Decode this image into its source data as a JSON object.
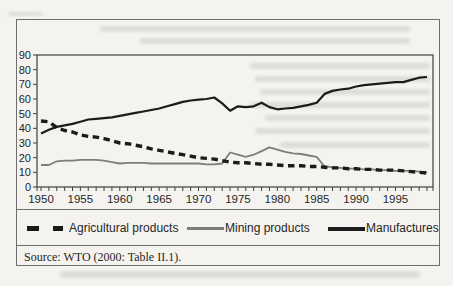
{
  "figure": {
    "source_note": "Source: WTO (2000: Table II.1)."
  },
  "chart_data": {
    "type": "line",
    "title": "",
    "xlabel": "",
    "ylabel": "",
    "ylim": [
      0,
      90
    ],
    "xlim": [
      1950,
      1999
    ],
    "grid": false,
    "legend_position": "bottom",
    "y_ticks": [
      90,
      80,
      70,
      60,
      50,
      40,
      30,
      20,
      10,
      0
    ],
    "x_tick_labels": [
      "1950",
      "1955",
      "1960",
      "1965",
      "1970",
      "1975",
      "1980",
      "1985",
      "1990",
      "1995"
    ],
    "x": [
      1950,
      1951,
      1952,
      1953,
      1954,
      1955,
      1956,
      1957,
      1958,
      1959,
      1960,
      1961,
      1962,
      1963,
      1964,
      1965,
      1966,
      1967,
      1968,
      1969,
      1970,
      1971,
      1972,
      1973,
      1974,
      1975,
      1976,
      1977,
      1978,
      1979,
      1980,
      1981,
      1982,
      1983,
      1984,
      1985,
      1986,
      1987,
      1988,
      1989,
      1990,
      1991,
      1992,
      1993,
      1994,
      1995,
      1996,
      1997,
      1998,
      1999
    ],
    "series": [
      {
        "name": "Agricultural products",
        "style": "dashed",
        "color": "#1b1b1b",
        "values": [
          45,
          44.5,
          40.5,
          38.5,
          37.5,
          35.5,
          34.5,
          34,
          33,
          31.5,
          30,
          29.5,
          28.5,
          27.5,
          26,
          25,
          24,
          23,
          22,
          21,
          20,
          19.5,
          19,
          18,
          17,
          16.5,
          16.5,
          16,
          15.5,
          15.5,
          15,
          14.5,
          14.5,
          14.5,
          14,
          14,
          13.5,
          13,
          13,
          12.5,
          12.5,
          12,
          12,
          11.5,
          11.5,
          11.5,
          11,
          10.5,
          10,
          9.5
        ]
      },
      {
        "name": "Mining products",
        "style": "solid",
        "color": "#7d7d7d",
        "values": [
          15,
          15,
          17.5,
          18,
          18,
          18.5,
          18.5,
          18.5,
          18,
          17,
          16,
          16.5,
          16.5,
          16.5,
          16,
          16,
          16,
          16,
          16,
          16,
          16,
          15.5,
          15.5,
          16,
          23.5,
          22,
          20.5,
          22,
          24.5,
          27,
          25.5,
          24,
          23,
          22.5,
          21.5,
          20.5,
          14,
          13.5,
          13,
          12.5,
          12.5,
          12,
          12,
          11.5,
          11.5,
          11,
          11,
          11,
          10.5,
          10
        ]
      },
      {
        "name": "Manufactures",
        "style": "solid",
        "color": "#1b1b1b",
        "values": [
          36.5,
          39,
          41,
          42,
          43,
          44.5,
          46,
          46.5,
          47,
          47.5,
          48.5,
          49.5,
          50.5,
          51.5,
          52.5,
          53.5,
          55,
          56.5,
          58,
          59,
          59.5,
          60,
          61,
          57,
          52,
          55,
          54.5,
          55,
          57.5,
          54.5,
          53,
          53.5,
          54,
          55,
          56,
          57.5,
          63.5,
          65.5,
          66.5,
          67,
          68.5,
          69.5,
          70,
          70.5,
          71,
          71.5,
          71.5,
          73,
          74.5,
          75
        ]
      }
    ]
  }
}
